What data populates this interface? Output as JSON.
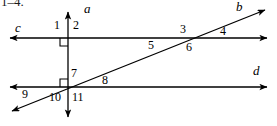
{
  "figure": {
    "exercise_range": "1–4.",
    "background_color": "#ffffff",
    "stroke_color": "#000000",
    "width": 277,
    "height": 126,
    "line_labels": [
      {
        "id": "a",
        "text": "a",
        "x": 84,
        "y": 8
      },
      {
        "id": "b",
        "text": "b",
        "x": 236,
        "y": 6
      },
      {
        "id": "c",
        "text": "c",
        "x": 15,
        "y": 26
      },
      {
        "id": "d",
        "text": "d",
        "x": 254,
        "y": 70
      }
    ],
    "angle_labels": [
      {
        "id": "1",
        "text": "1",
        "x": 54,
        "y": 24
      },
      {
        "id": "2",
        "text": "2",
        "x": 73,
        "y": 24
      },
      {
        "id": "3",
        "text": "3",
        "x": 180,
        "y": 27
      },
      {
        "id": "4",
        "text": "4",
        "x": 220,
        "y": 28
      },
      {
        "id": "5",
        "text": "5",
        "x": 148,
        "y": 42
      },
      {
        "id": "6",
        "text": "6",
        "x": 186,
        "y": 44
      },
      {
        "id": "7",
        "text": "7",
        "x": 72,
        "y": 70
      },
      {
        "id": "8",
        "text": "8",
        "x": 102,
        "y": 76
      },
      {
        "id": "9",
        "text": "9",
        "x": 22,
        "y": 90
      },
      {
        "id": "10",
        "text": "10",
        "x": 50,
        "y": 95
      },
      {
        "id": "11",
        "text": "11",
        "x": 73,
        "y": 95
      }
    ],
    "right_angle_marks": [
      {
        "id": "upper",
        "corner_x": 68,
        "corner_y": 38,
        "position": "below-left"
      },
      {
        "id": "lower",
        "corner_x": 68,
        "corner_y": 87,
        "position": "above-left"
      }
    ],
    "lines": [
      {
        "id": "a",
        "description": "vertical-line",
        "x1": 68,
        "y1": 8,
        "x2": 68,
        "y2": 120,
        "arrows": "both"
      },
      {
        "id": "b",
        "description": "transversal-diagonal",
        "x1": 8,
        "y1": 113,
        "x2": 269,
        "y2": 8,
        "arrows": "both"
      },
      {
        "id": "c",
        "description": "horizontal-upper",
        "x1": 6,
        "y1": 38,
        "x2": 271,
        "y2": 38,
        "arrows": "both"
      },
      {
        "id": "d",
        "description": "horizontal-lower",
        "x1": 6,
        "y1": 87,
        "x2": 271,
        "y2": 87,
        "arrows": "both"
      }
    ],
    "intersections": [
      {
        "id": "a-c",
        "x": 68,
        "y": 38
      },
      {
        "id": "b-c",
        "x": 185,
        "y": 38
      },
      {
        "id": "a-d-b",
        "x": 68,
        "y": 87
      }
    ]
  }
}
